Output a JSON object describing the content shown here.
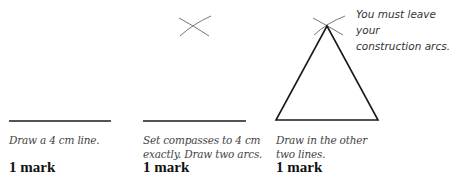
{
  "panels": [
    {
      "caption_line1": "Draw a 4 cm line.",
      "caption_line2": "",
      "mark": "1 mark"
    },
    {
      "caption_line1": "Set compasses to 4 cm",
      "caption_line2": "exactly. Draw two arcs.",
      "mark": "1 mark"
    },
    {
      "caption_line1": "Draw in the other",
      "caption_line2": "two lines.",
      "mark": "1 mark"
    }
  ],
  "note": {
    "line1": "You must leave your",
    "line2": "construction arcs."
  },
  "colors": {
    "line": "#1a1a1a",
    "arc": "#666666",
    "caption": "#444444"
  }
}
